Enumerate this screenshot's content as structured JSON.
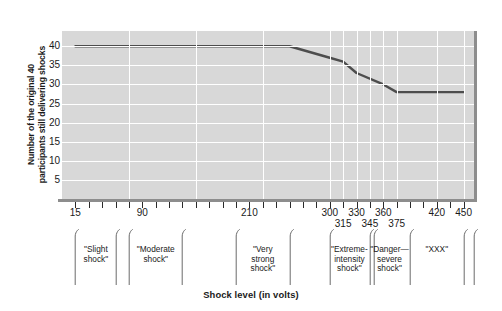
{
  "chart_data": {
    "type": "line",
    "title": "",
    "xlabel": "Shock level (in volts)",
    "ylabel_line1": "Number of the original 40",
    "ylabel_line2": "participants still delivering shocks",
    "xlim": [
      0,
      465
    ],
    "ylim": [
      0,
      44
    ],
    "yticks": [
      5,
      10,
      15,
      20,
      25,
      30,
      35,
      40
    ],
    "xtick_positions": [
      15,
      30,
      45,
      60,
      75,
      90,
      105,
      120,
      135,
      150,
      165,
      180,
      195,
      210,
      225,
      240,
      255,
      270,
      285,
      300,
      315,
      330,
      345,
      360,
      375,
      390,
      405,
      420,
      435,
      450
    ],
    "xtick_labels": [
      {
        "value": 15,
        "text": "15",
        "row": 0
      },
      {
        "value": 90,
        "text": "90",
        "row": 0
      },
      {
        "value": 210,
        "text": "210",
        "row": 0
      },
      {
        "value": 300,
        "text": "300",
        "row": 0
      },
      {
        "value": 315,
        "text": "315",
        "row": 1
      },
      {
        "value": 330,
        "text": "330",
        "row": 0
      },
      {
        "value": 345,
        "text": "345",
        "row": 1
      },
      {
        "value": 360,
        "text": "360",
        "row": 0
      },
      {
        "value": 375,
        "text": "375",
        "row": 1
      },
      {
        "value": 420,
        "text": "420",
        "row": 0
      },
      {
        "value": 450,
        "text": "450",
        "row": 0
      }
    ],
    "gridlines_x": [
      75,
      150,
      225,
      300,
      315,
      330,
      345,
      360,
      375,
      420,
      450
    ],
    "grid": true,
    "legend": "none",
    "series": [
      {
        "name": "Participants still delivering shocks",
        "color": "#4d4d4d",
        "x": [
          15,
          150,
          255,
          300,
          315,
          330,
          360,
          375,
          450
        ],
        "values": [
          40,
          40,
          40,
          37,
          36,
          33,
          30,
          28,
          28
        ]
      }
    ],
    "categories": [
      {
        "label": "\"Slight\nshock\"",
        "start": 15,
        "end": 60,
        "center": 38
      },
      {
        "label": "\"Moderate\nshock\"",
        "start": 75,
        "end": 135,
        "center": 105
      },
      {
        "label": "\"Very\nstrong\nshock\"",
        "start": 195,
        "end": 255,
        "center": 225
      },
      {
        "label": "\"Extreme-\nintensity\nshock\"",
        "start": 300,
        "end": 345,
        "center": 322
      },
      {
        "label": "\"Danger—\nsevere\nshock\"",
        "start": 345,
        "end": 390,
        "center": 367
      },
      {
        "label": "\"XXX\"",
        "start": 390,
        "end": 450,
        "center": 420
      }
    ],
    "category_dividers": [
      15,
      60,
      75,
      135,
      195,
      255,
      300,
      345,
      350,
      390,
      450,
      462
    ],
    "colors": {
      "plot_background": "#d8d8d8",
      "gridline": "#ffffff",
      "line": "#4d4d4d",
      "axis": "#8d8d8d",
      "text": "#1a1a1a"
    }
  }
}
